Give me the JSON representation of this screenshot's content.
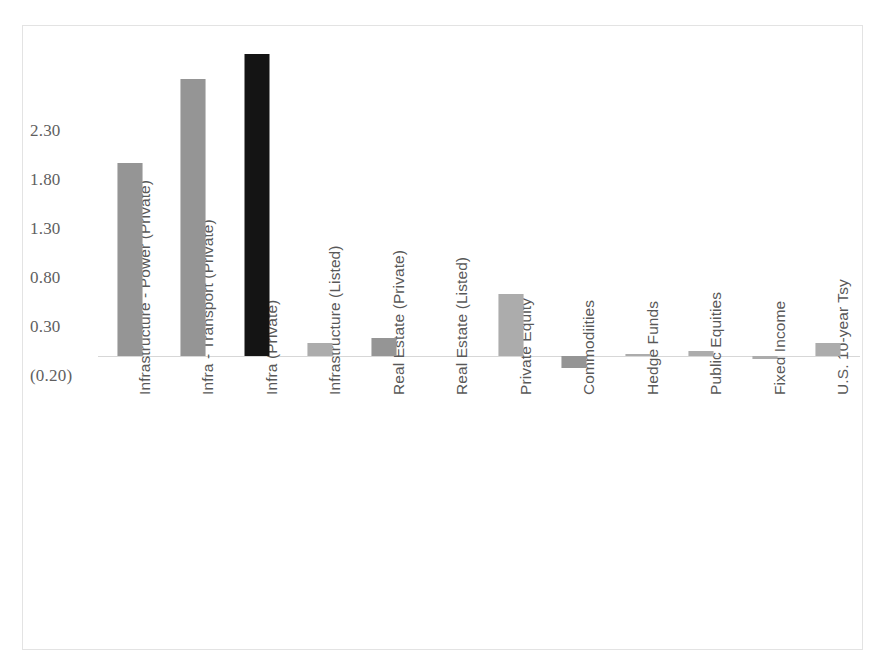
{
  "chart_data": {
    "type": "bar",
    "title": "",
    "subtitle": "",
    "xlabel": "",
    "ylabel": "",
    "ylim": [
      -0.2,
      3.3
    ],
    "grid": false,
    "legend": "none",
    "y_ticks": [
      "2.30",
      "1.80",
      "1.30",
      "0.80",
      "0.30",
      "(0.20)"
    ],
    "y_tick_values": [
      2.3,
      1.8,
      1.3,
      0.8,
      0.3,
      -0.2
    ],
    "categories": [
      "Infrastructure - Power (Private)",
      "Infra - Transport (Private)",
      "Infra (Private)",
      "Infrastructure (Listed)",
      "Real Estate (Private)",
      "Real Estate (Listed)",
      "Private Equity",
      "Commodiities",
      "Hedge Funds",
      "Public Equities",
      "Fixed Income",
      "U.S. 10-year Tsy"
    ],
    "values": [
      1.97,
      2.83,
      3.08,
      0.13,
      0.18,
      0.0,
      0.63,
      -0.12,
      0.02,
      0.05,
      -0.03,
      0.13
    ],
    "bar_styles": [
      "gray",
      "gray",
      "black",
      "lightgray",
      "gray",
      "zero",
      "lightgray",
      "gray",
      "lightgray",
      "lightgray",
      "lightgray",
      "lightgray"
    ],
    "colors": {
      "bar_gray": "#828282",
      "bar_light_gray": "#9a9a9a",
      "bar_black": "#141414",
      "axis_line": "#d7d7d7",
      "frame": "#e3e3e3",
      "tick_text": "#5f5f5f",
      "category_text": "#585858",
      "background": "#ffffff"
    }
  }
}
